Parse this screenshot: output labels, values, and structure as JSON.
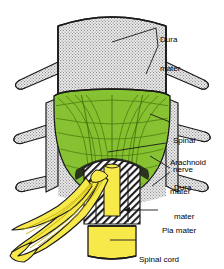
{
  "figure": {
    "colors": {
      "dura_fill": "#e8e8e8",
      "dura_stipple": "#9a9a9a",
      "arachnoid_green": "#86c232",
      "arachnoid_green_dark": "#5d9116",
      "nerve_yellow": "#f7e94a",
      "nerve_yellow_dark": "#c9b400",
      "outline": "#1a1a1a",
      "leader_line": "#1a1a1a",
      "label_text": "#000000",
      "background": "#ffffff"
    },
    "labels": [
      {
        "id": "dura-mater-top",
        "line1": "Dura",
        "line2": "mater",
        "x": 160,
        "y": 16
      },
      {
        "id": "spinal-nerve",
        "line1": "Spinal",
        "line2": "nerve",
        "x": 173,
        "y": 117
      },
      {
        "id": "arachnoid-mater",
        "line1": "Arachnoid",
        "line2": "mater",
        "x": 170,
        "y": 139
      },
      {
        "id": "dura-mater-mid",
        "line1": "Dura",
        "line2": "mater",
        "x": 174,
        "y": 164
      },
      {
        "id": "pia-mater",
        "line1": "Pia mater",
        "line2": "",
        "x": 162,
        "y": 207
      },
      {
        "id": "spinal-cord",
        "line1": "Spinal cord",
        "line2": "",
        "x": 139,
        "y": 236
      }
    ],
    "structures": [
      {
        "id": "dura-sheath-upper",
        "name": "Dura mater sheath (upper tube)"
      },
      {
        "id": "arachnoid-mater-body",
        "name": "Arachnoid mater (green fibrous layer)"
      },
      {
        "id": "dura-cut-edge",
        "name": "Dura mater cut edge (hatched)"
      },
      {
        "id": "pia-mater-sleeve",
        "name": "Pia mater sleeve"
      },
      {
        "id": "spinal-cord-core",
        "name": "Spinal cord (yellow core)"
      },
      {
        "id": "nerve-roots",
        "name": "Spinal nerve roots (yellow strands)"
      },
      {
        "id": "spinal-nerve-left-1",
        "name": "Left spinal nerve branch upper"
      },
      {
        "id": "spinal-nerve-left-2",
        "name": "Left spinal nerve branch middle"
      },
      {
        "id": "spinal-nerve-left-3",
        "name": "Left spinal nerve branch lower"
      },
      {
        "id": "spinal-nerve-right-1",
        "name": "Right spinal nerve branch upper"
      },
      {
        "id": "spinal-nerve-right-2",
        "name": "Right spinal nerve branch middle"
      },
      {
        "id": "spinal-nerve-right-3",
        "name": "Right spinal nerve branch lower"
      }
    ]
  }
}
